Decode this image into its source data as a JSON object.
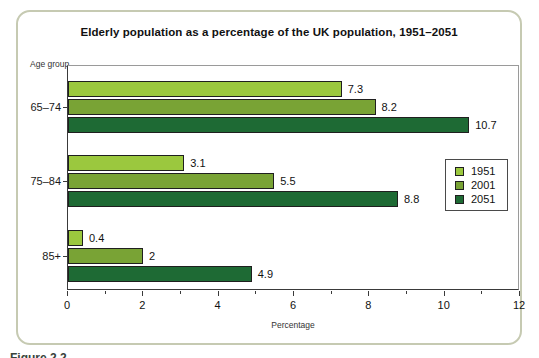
{
  "figure": {
    "title": "Elderly population as a percentage of the UK population, 1951–2051",
    "y_axis_title": "Age group",
    "x_axis_title": "Percentage",
    "caption": "Figure 2.2"
  },
  "colors": {
    "frame_border": "#c6cab2",
    "bar_border": "#1f1f1f",
    "series_1951": "#9bc83e",
    "series_2001": "#79a335",
    "series_2051": "#1e6a34"
  },
  "chart_data": {
    "type": "bar",
    "orientation": "horizontal",
    "title": "Elderly population as a percentage of the UK population, 1951–2051",
    "categories": [
      "65–74",
      "75–84",
      "85+"
    ],
    "series": [
      {
        "name": "1951",
        "color": "#9bc83e",
        "values": [
          7.3,
          3.1,
          0.4
        ],
        "labels": [
          "7.3",
          "3.1",
          "0.4"
        ]
      },
      {
        "name": "2001",
        "color": "#79a335",
        "values": [
          8.2,
          5.5,
          2
        ],
        "labels": [
          "8.2",
          "5.5",
          "2"
        ]
      },
      {
        "name": "2051",
        "color": "#1e6a34",
        "values": [
          10.7,
          8.8,
          4.9
        ],
        "labels": [
          "10.7",
          "8.8",
          "4.9"
        ]
      }
    ],
    "xlabel": "Percentage",
    "ylabel": "Age group",
    "xlim": [
      0,
      12
    ],
    "xticks": [
      0,
      2,
      4,
      6,
      8,
      10,
      12
    ],
    "minor_xticks": [
      1,
      3,
      5,
      7,
      9,
      11
    ],
    "grid": false,
    "legend_position": "right-inside"
  },
  "layout": {
    "group_tops_px": [
      15,
      89,
      164
    ]
  }
}
